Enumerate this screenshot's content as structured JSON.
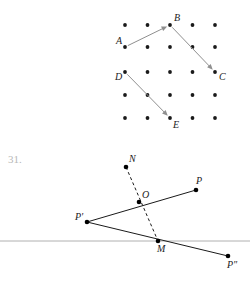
{
  "page": {
    "background": "#ffffff",
    "width": 250,
    "height": 283
  },
  "problem": {
    "number_label": "31.",
    "number_color": "#b8b8b8"
  },
  "figure_top": {
    "name": "dot-grid-vector-figure",
    "grid": {
      "columns_x": [
        125,
        147.5,
        170,
        192.5,
        215
      ],
      "rows_y": [
        25,
        47,
        72,
        95,
        118
      ],
      "dot_radius": 1.9,
      "dot_color": "#1a1a1a"
    },
    "points": [
      {
        "id": "A",
        "label": "A",
        "x": 125,
        "y": 47,
        "label_dx": -9,
        "label_dy": -3
      },
      {
        "id": "B",
        "label": "B",
        "x": 170,
        "y": 25,
        "label_dx": 4,
        "label_dy": -4
      },
      {
        "id": "C",
        "label": "C",
        "x": 215,
        "y": 72,
        "label_dx": 4,
        "label_dy": 8
      },
      {
        "id": "D",
        "label": "D",
        "x": 125,
        "y": 72,
        "label_dx": -10,
        "label_dy": 8
      },
      {
        "id": "E",
        "label": "E",
        "x": 170,
        "y": 118,
        "label_dx": 3,
        "label_dy": 10
      }
    ],
    "vectors": [
      {
        "name": "vector-a-to-b",
        "from": "A",
        "to": "B",
        "color": "#8f8f8f"
      },
      {
        "name": "vector-b-to-c",
        "from": "B",
        "to": "C",
        "color": "#8f8f8f"
      },
      {
        "name": "vector-d-to-e",
        "from": "D",
        "to": "E",
        "color": "#8f8f8f"
      }
    ]
  },
  "figure_bottom": {
    "name": "reflection-construction-figure",
    "axis": {
      "name": "mirror-line",
      "x1": 0,
      "y1": 241,
      "x2": 250,
      "y2": 241,
      "color": "#b0b0b0"
    },
    "points": [
      {
        "id": "N",
        "label": "N",
        "x": 126,
        "y": 167,
        "label_dx": 3,
        "label_dy": -5
      },
      {
        "id": "O",
        "label": "O",
        "x": 139,
        "y": 202,
        "label_dx": 3,
        "label_dy": -4
      },
      {
        "id": "P",
        "label": "P",
        "x": 196,
        "y": 190,
        "label_dx": 0,
        "label_dy": -6
      },
      {
        "id": "Pp",
        "label": "P'",
        "x": 87,
        "y": 222,
        "label_dx": -12,
        "label_dy": -2
      },
      {
        "id": "M",
        "label": "M",
        "x": 158,
        "y": 241,
        "label_dx": -1,
        "label_dy": 11
      },
      {
        "id": "Ppp",
        "label": "P\"",
        "x": 228,
        "y": 256,
        "label_dx": -1,
        "label_dy": 12
      }
    ],
    "segments": [
      {
        "name": "segment-pprime-to-p",
        "from": "Pp",
        "to": "P",
        "style": "solid"
      },
      {
        "name": "segment-pprime-to-pdbl",
        "from": "Pp",
        "to": "Ppp",
        "style": "solid"
      },
      {
        "name": "segment-n-to-m-dashed",
        "from": "N",
        "to": "M",
        "style": "dashed"
      }
    ]
  }
}
